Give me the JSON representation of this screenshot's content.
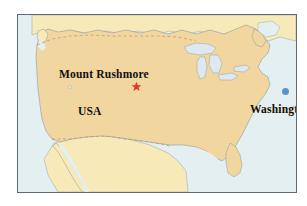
{
  "figure": {
    "kind": "map",
    "region": "United States of America",
    "frame_border_color": "#5c6b74",
    "page_background": "#ffffff"
  },
  "palette": {
    "ocean": "#e4eff2",
    "usa_land": "#f2d6a0",
    "neighbor_land": "#f7eab8",
    "lake_fill": "#dde9ef",
    "coastline": "#8a9aa6",
    "national_border": "#b09a74",
    "star_red": "#e8352e",
    "capital_blue": "#5b93c7",
    "label_text": "#101010"
  },
  "labels": {
    "mount_rushmore": "Mount Rushmore",
    "usa": "USA",
    "washington": "Washington"
  },
  "markers": {
    "mount_rushmore_star": "star-marker",
    "washington_dot": "capital-dot-marker"
  },
  "icons": {
    "star": "red-star-icon",
    "capital": "blue-circle-icon"
  }
}
